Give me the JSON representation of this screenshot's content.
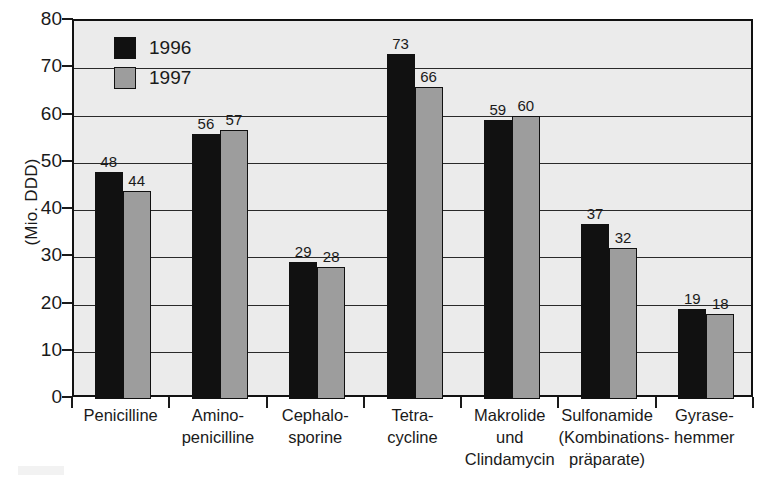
{
  "chart_data": {
    "type": "bar",
    "title": "",
    "xlabel": "",
    "ylabel": "(Mio. DDD)",
    "ylim": [
      0,
      80
    ],
    "yticks": [
      0,
      10,
      20,
      30,
      40,
      50,
      60,
      70,
      80
    ],
    "grid": true,
    "legend_position": "top-left",
    "categories": [
      [
        "Penicilline"
      ],
      [
        "Amino-",
        "penicilline"
      ],
      [
        "Cephalo-",
        "sporine"
      ],
      [
        "Tetra-",
        "cycline"
      ],
      [
        "Makrolide",
        "und",
        "Clindamycin"
      ],
      [
        "Sulfonamide",
        "(Kombinations-",
        "präparate)"
      ],
      [
        "Gyrase-",
        "hemmer"
      ]
    ],
    "category_labels_flat": [
      "Penicilline",
      "Amino-penicilline",
      "Cephalo-sporine",
      "Tetra-cycline",
      "Makrolide und Clindamycin",
      "Sulfonamide (Kombinationspräparate)",
      "Gyrase-hemmer"
    ],
    "series": [
      {
        "name": "1996",
        "color": "#111111",
        "values": [
          48,
          56,
          29,
          73,
          59,
          37,
          19
        ]
      },
      {
        "name": "1997",
        "color": "#9d9d9d",
        "values": [
          44,
          57,
          28,
          66,
          60,
          32,
          18
        ]
      }
    ]
  },
  "legend": {
    "items": [
      {
        "label": "1996",
        "color": "#111111"
      },
      {
        "label": "1997",
        "color": "#9d9d9d"
      }
    ]
  },
  "axes": {
    "y_title": "(Mio. DDD)",
    "y_tick_labels": [
      "80",
      "70",
      "60",
      "50",
      "40",
      "30",
      "20",
      "10",
      "0"
    ]
  },
  "colors": {
    "plot_background": "#ebebeb",
    "page_background": "#ffffff",
    "axis": "#111111",
    "gridline": "#2a2a2a",
    "series_1996": "#111111",
    "series_1997": "#9d9d9d"
  }
}
